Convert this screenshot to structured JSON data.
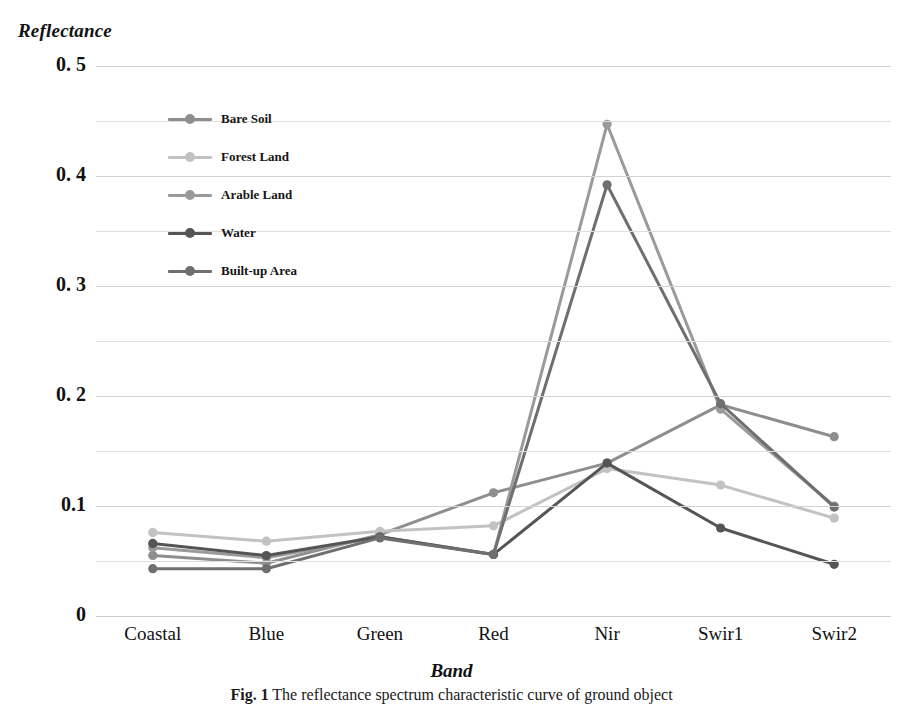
{
  "figure": {
    "y_axis_title": "Reflectance",
    "x_axis_title": "Band",
    "caption_label": "Fig. 1",
    "caption_text": "The reflectance spectrum characteristic curve of ground object"
  },
  "chart_data": {
    "type": "line",
    "title": "",
    "xlabel": "Band",
    "ylabel": "Reflectance",
    "categories": [
      "Coastal",
      "Blue",
      "Green",
      "Red",
      "Nir",
      "Swir1",
      "Swir2"
    ],
    "ylim": [
      0,
      0.5
    ],
    "ytick_labels": [
      "0. 5",
      "0. 4",
      "0. 3",
      "0. 2",
      "0.1",
      "0"
    ],
    "ytick_values": [
      0.5,
      0.4,
      0.3,
      0.2,
      0.1,
      0
    ],
    "grid": true,
    "minor_gridlines": true,
    "legend_position": "inside-upper-left",
    "series": [
      {
        "name": "Bare Soil",
        "color": "#8e8e8e",
        "values": [
          0.055,
          0.048,
          0.074,
          0.112,
          0.139,
          0.192,
          0.163
        ]
      },
      {
        "name": "Forest Land",
        "color": "#c2c2c2",
        "values": [
          0.076,
          0.068,
          0.077,
          0.082,
          0.134,
          0.119,
          0.089
        ]
      },
      {
        "name": "Arable Land",
        "color": "#9a9a9a",
        "values": [
          0.062,
          0.053,
          0.072,
          0.056,
          0.447,
          0.188,
          0.1
        ]
      },
      {
        "name": "Water",
        "color": "#555555",
        "values": [
          0.066,
          0.055,
          0.072,
          0.056,
          0.139,
          0.08,
          0.047
        ]
      },
      {
        "name": "Built-up Area",
        "color": "#6f6f6f",
        "values": [
          0.043,
          0.043,
          0.071,
          0.056,
          0.392,
          0.193,
          0.099
        ]
      }
    ]
  }
}
